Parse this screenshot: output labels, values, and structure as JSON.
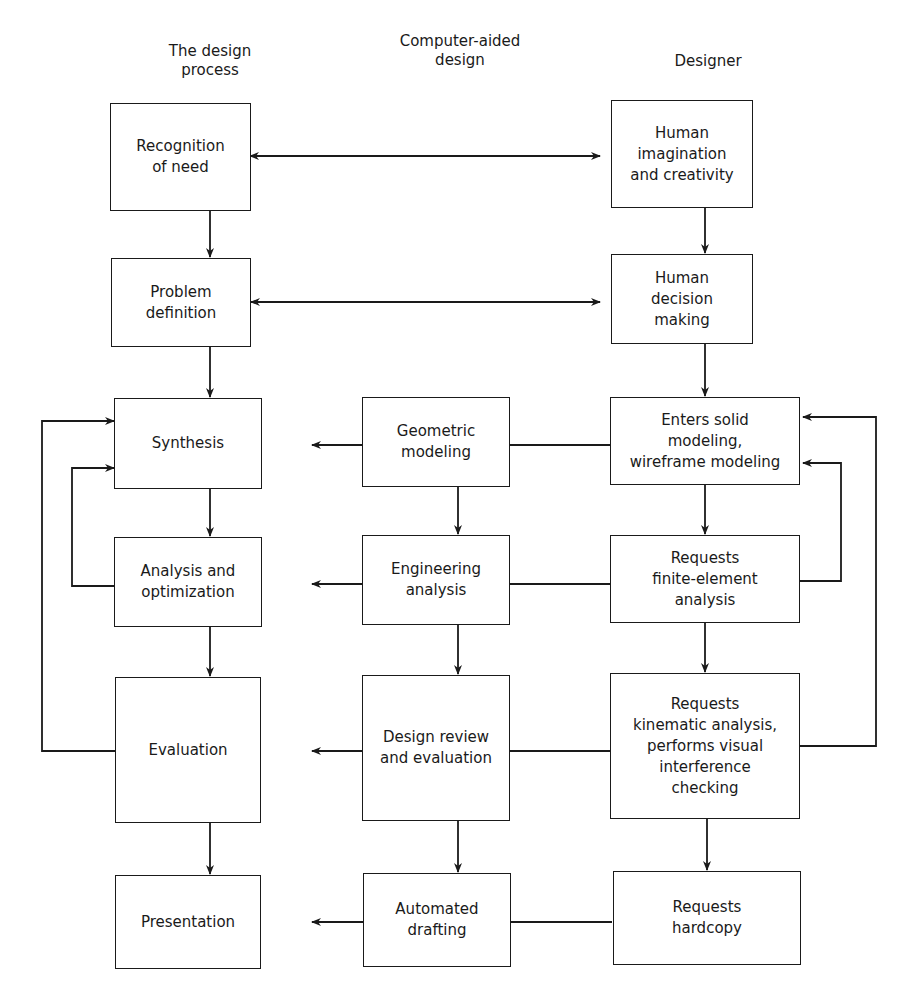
{
  "columns": {
    "design_process": "The design\nprocess",
    "cad": "Computer-aided\ndesign",
    "designer": "Designer"
  },
  "boxes": {
    "recognition": "Recognition\nof need",
    "imagination": "Human\nimagination\nand creativity",
    "problem": "Problem\ndefinition",
    "decision": "Human\ndecision\nmaking",
    "synthesis": "Synthesis",
    "geometric": "Geometric\nmodeling",
    "enters_solid": "Enters solid\nmodeling,\nwireframe modeling",
    "analysis_opt": "Analysis and\noptimization",
    "eng_analysis": "Engineering\nanalysis",
    "requests_fea": "Requests\nfinite-element\nanalysis",
    "evaluation": "Evaluation",
    "design_review": "Design review\nand evaluation",
    "requests_kinematic": "Requests\nkinematic analysis,\nperforms visual\ninterference\nchecking",
    "presentation": "Presentation",
    "automated_drafting": "Automated\ndrafting",
    "requests_hardcopy": "Requests\nhardcopy"
  }
}
